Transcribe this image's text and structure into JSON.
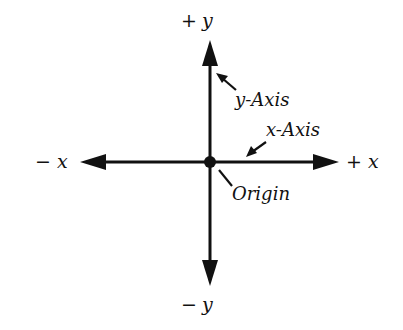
{
  "diagram": {
    "labels": {
      "pos_y": {
        "sign": "+",
        "var": "y"
      },
      "neg_y": {
        "sign": "−",
        "var": "y"
      },
      "pos_x": {
        "sign": "+",
        "var": "x"
      },
      "neg_x": {
        "sign": "−",
        "var": "x"
      },
      "y_axis": {
        "var": "y",
        "word": "-Axis"
      },
      "x_axis": {
        "var": "x",
        "word": "-Axis"
      },
      "origin": "Origin"
    },
    "colors": {
      "ink": "#111111",
      "background": "#ffffff"
    }
  }
}
